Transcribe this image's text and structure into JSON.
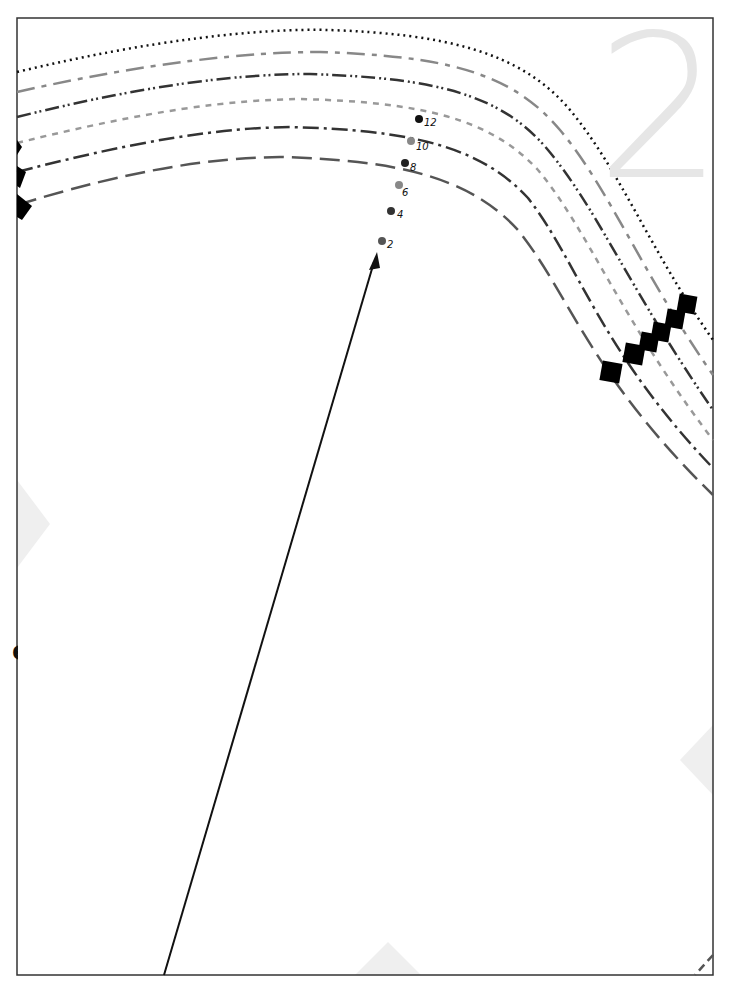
{
  "page": {
    "page_number": "2",
    "edge_fragment_text": "e"
  },
  "size_markers": [
    {
      "label": "12",
      "color": "#111111"
    },
    {
      "label": "10",
      "color": "#888888"
    },
    {
      "label": "8",
      "color": "#222222"
    },
    {
      "label": "6",
      "color": "#888888"
    },
    {
      "label": "4",
      "color": "#333333"
    },
    {
      "label": "2",
      "color": "#555555"
    }
  ],
  "cut_lines": [
    {
      "size": "12",
      "style": "dotted",
      "color": "#111111"
    },
    {
      "size": "10",
      "style": "long-dash",
      "color": "#888888"
    },
    {
      "size": "8",
      "style": "dash-dot-dot",
      "color": "#333333"
    },
    {
      "size": "6",
      "style": "short-dash",
      "color": "#999999"
    },
    {
      "size": "4",
      "style": "dash-dot",
      "color": "#333333"
    },
    {
      "size": "2",
      "style": "long-dash",
      "color": "#555555"
    }
  ],
  "colors": {
    "border": "#333333",
    "watermark": "#e6e6e6",
    "alignment_marker": "#eeeeee",
    "notch": "#000000"
  }
}
